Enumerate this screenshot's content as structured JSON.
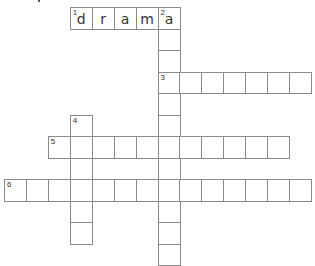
{
  "puzzle": {
    "type": "crossword",
    "cell_size": 22,
    "origin": {
      "x": 4,
      "y": 7
    },
    "row_height": 21.5,
    "col_width": 21.93,
    "border_color": "#8a8a8a",
    "words": [
      {
        "number": "1",
        "direction": "across",
        "row": 0,
        "col": 3,
        "length": 5,
        "letters": [
          "d",
          "r",
          "a",
          "m",
          "a"
        ]
      },
      {
        "number": "2",
        "direction": "down",
        "row": 0,
        "col": 7,
        "length": 12,
        "letters": [
          "a",
          "",
          "",
          "",
          "",
          "",
          "",
          "",
          "",
          "",
          "",
          ""
        ]
      },
      {
        "number": "3",
        "direction": "across",
        "row": 3,
        "col": 7,
        "length": 7,
        "letters": [
          "",
          "",
          "",
          "",
          "",
          "",
          ""
        ]
      },
      {
        "number": "4",
        "direction": "down",
        "row": 5,
        "col": 3,
        "length": 6,
        "letters": [
          "",
          "",
          "",
          "",
          "",
          ""
        ]
      },
      {
        "number": "5",
        "direction": "across",
        "row": 6,
        "col": 2,
        "length": 11,
        "letters": [
          "",
          "",
          "",
          "",
          "",
          "",
          "",
          "",
          "",
          "",
          ""
        ]
      },
      {
        "number": "6",
        "direction": "across",
        "row": 8,
        "col": 0,
        "length": 14,
        "letters": [
          "",
          "",
          "",
          "",
          "",
          "",
          "",
          "",
          "",
          "",
          "",
          "",
          "",
          ""
        ]
      }
    ]
  }
}
